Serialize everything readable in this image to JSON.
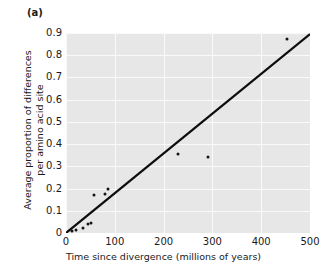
{
  "panel": {
    "label": "(a)"
  },
  "chart_data": {
    "type": "scatter",
    "title": "",
    "xlabel": "Time since divergence (millions of years)",
    "ylabel_lines": [
      "Average proportion of differences",
      "per amino acid site"
    ],
    "ylabel": "Average proportion of differences per amino acid site",
    "xlim": [
      0,
      500
    ],
    "ylim": [
      0,
      0.9
    ],
    "xticks": [
      0,
      100,
      200,
      300,
      400,
      500
    ],
    "xtick_labels": [
      "0",
      "100",
      "200",
      "300",
      "400",
      "500"
    ],
    "yticks": [
      0,
      0.1,
      0.2,
      0.3,
      0.4,
      0.5,
      0.6,
      0.7,
      0.8,
      0.9
    ],
    "ytick_labels": [
      "0",
      "0.1",
      "0.2",
      "0.3",
      "0.4",
      "0.5",
      "0.6",
      "0.7",
      "0.8",
      "0.9"
    ],
    "grid": true,
    "grid_color": "#fafafa",
    "plot_background": "#e7e7e7",
    "legend": null,
    "point_color": "#141414",
    "line_color": "#0d0d0d",
    "points": [
      {
        "x": 12,
        "y": 0.008
      },
      {
        "x": 20,
        "y": 0.012
      },
      {
        "x": 35,
        "y": 0.022
      },
      {
        "x": 45,
        "y": 0.042
      },
      {
        "x": 52,
        "y": 0.045
      },
      {
        "x": 57,
        "y": 0.172
      },
      {
        "x": 80,
        "y": 0.175
      },
      {
        "x": 86,
        "y": 0.196
      },
      {
        "x": 230,
        "y": 0.356
      },
      {
        "x": 290,
        "y": 0.344
      },
      {
        "x": 452,
        "y": 0.872
      }
    ],
    "trend_line": {
      "x0": 0,
      "y0": 0.0,
      "x1": 500,
      "y1": 0.895,
      "slope": 0.00179,
      "intercept": 0.0
    }
  }
}
